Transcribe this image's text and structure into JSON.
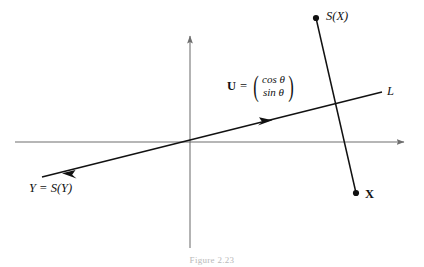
{
  "figure": {
    "caption": "Figure 2.23",
    "background_color": "#ffffff",
    "ink_color": "#111111",
    "axis_color": "#6e6e6e"
  },
  "labels": {
    "point_sx": "S(X)",
    "point_x": "X",
    "line_l": "L",
    "point_y": "Y = S(Y)",
    "vector_symbol": "U",
    "equals": "=",
    "vector_row1": "cos θ",
    "vector_row2": "sin θ"
  },
  "geometry": {
    "x_axis": {
      "x1": 15,
      "y1": 142,
      "x2": 410,
      "y2": 142
    },
    "y_axis": {
      "x1": 190,
      "y1": 248,
      "x2": 190,
      "y2": 30
    },
    "line_l": {
      "x1": 42,
      "y1": 177,
      "x2": 382,
      "y2": 92
    },
    "segment_x_sx": {
      "x1": 316,
      "y1": 18,
      "x2": 356,
      "y2": 193
    },
    "dot_sx": {
      "cx": 316,
      "cy": 18,
      "r": 3.1
    },
    "dot_x": {
      "cx": 356,
      "cy": 193,
      "r": 3.1
    },
    "arrow_forward_on_l": {
      "x": 265,
      "y": 122
    },
    "arrow_backward_on_l": {
      "x": 69,
      "y": 171
    }
  }
}
